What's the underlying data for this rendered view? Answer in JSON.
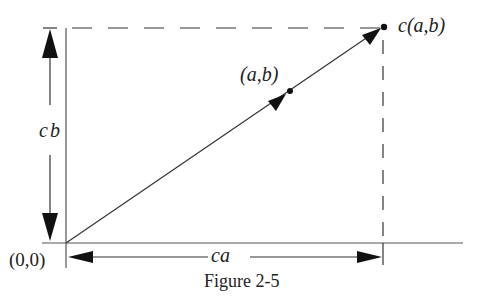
{
  "figure": {
    "caption": "Figure 2-5",
    "labels": {
      "origin": "(0,0)",
      "point": "(a,b)",
      "scaled_point": "c(a,b)",
      "vertical_length": "cb",
      "horizontal_length": "ca"
    },
    "colors": {
      "ink": "#222222",
      "axis": "#555555",
      "background": "#ffffff"
    },
    "points": {
      "origin": [
        66,
        243
      ],
      "ab": [
        290,
        91
      ],
      "cab": [
        383,
        27
      ]
    }
  }
}
